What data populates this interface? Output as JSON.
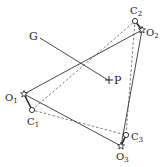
{
  "diagram": {
    "colors": {
      "stroke": "#333333",
      "background": "#ffffff"
    },
    "points": {
      "G": {
        "label": "G",
        "x": 40,
        "y": 38
      },
      "P": {
        "label": "P",
        "x": 110,
        "y": 80
      },
      "O1": {
        "label": "O",
        "sub": "1",
        "x": 24,
        "y": 94,
        "marker": "star-icon"
      },
      "O2": {
        "label": "O",
        "sub": "2",
        "x": 142,
        "y": 30,
        "marker": "star-icon"
      },
      "O3": {
        "label": "O",
        "sub": "3",
        "x": 121,
        "y": 146,
        "marker": "star-icon"
      },
      "C1": {
        "label": "C",
        "sub": "1",
        "x": 32,
        "y": 110,
        "marker": "circle-icon"
      },
      "C2": {
        "label": "C",
        "sub": "2",
        "x": 135,
        "y": 21,
        "marker": "circle-icon"
      },
      "C3": {
        "label": "C",
        "sub": "3",
        "x": 126,
        "y": 135,
        "marker": "circle-icon"
      }
    },
    "solid_triangle": [
      "O1",
      "O2",
      "O3"
    ],
    "dashed_triangle": [
      "C1",
      "C2",
      "C3"
    ],
    "segments": [
      [
        "G",
        "P"
      ],
      [
        "O1",
        "C1"
      ],
      [
        "O2",
        "C2"
      ],
      [
        "O3",
        "C3"
      ]
    ]
  }
}
